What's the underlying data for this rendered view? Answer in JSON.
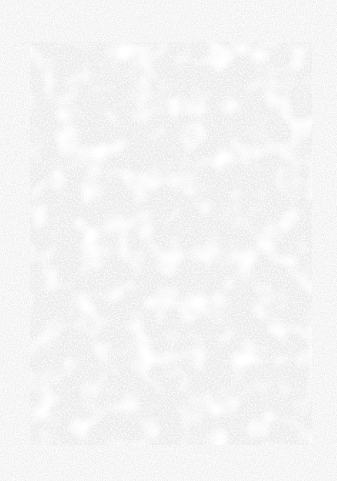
{
  "page": {
    "background_color": "#fcfcfc",
    "rect_color": "#ececec",
    "rect": {
      "x": 30,
      "y": 42,
      "width": 282,
      "height": 403
    }
  }
}
